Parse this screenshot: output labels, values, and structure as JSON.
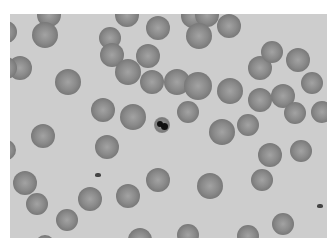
{
  "image": {
    "description": "Grayscale light micrograph of a blood smear showing many red blood cells and one central leukocyte with dark nucleus",
    "frame": {
      "x": 10,
      "y": 14,
      "width": 317,
      "height": 224
    },
    "colors": {
      "background": "#cdcdcd",
      "rbc_edge": "#6f6f6f",
      "rbc_center": "#a3a3a3",
      "nucleus": "#111111",
      "border": "#ffffff"
    },
    "cells": [
      [
        49,
        15,
        12
      ],
      [
        45,
        35,
        13
      ],
      [
        6,
        32,
        11
      ],
      [
        20,
        68,
        12
      ],
      [
        6,
        68,
        11
      ],
      [
        68,
        82,
        13
      ],
      [
        110,
        38,
        11
      ],
      [
        112,
        55,
        12
      ],
      [
        127,
        15,
        12
      ],
      [
        158,
        28,
        12
      ],
      [
        193,
        16,
        12
      ],
      [
        207,
        15,
        12
      ],
      [
        199,
        36,
        13
      ],
      [
        229,
        26,
        12
      ],
      [
        148,
        56,
        12
      ],
      [
        128,
        72,
        13
      ],
      [
        152,
        82,
        12
      ],
      [
        177,
        82,
        13
      ],
      [
        198,
        86,
        14
      ],
      [
        230,
        91,
        13
      ],
      [
        260,
        68,
        12
      ],
      [
        272,
        52,
        11
      ],
      [
        298,
        60,
        12
      ],
      [
        312,
        83,
        11
      ],
      [
        322,
        112,
        11
      ],
      [
        260,
        100,
        12
      ],
      [
        283,
        96,
        12
      ],
      [
        295,
        113,
        11
      ],
      [
        248,
        125,
        11
      ],
      [
        222,
        132,
        13
      ],
      [
        188,
        112,
        11
      ],
      [
        133,
        117,
        13
      ],
      [
        103,
        110,
        12
      ],
      [
        43,
        136,
        12
      ],
      [
        6,
        150,
        10
      ],
      [
        107,
        147,
        12
      ],
      [
        270,
        155,
        12
      ],
      [
        301,
        151,
        11
      ],
      [
        25,
        183,
        12
      ],
      [
        37,
        204,
        11
      ],
      [
        67,
        220,
        11
      ],
      [
        90,
        199,
        12
      ],
      [
        128,
        196,
        12
      ],
      [
        158,
        180,
        12
      ],
      [
        210,
        186,
        13
      ],
      [
        262,
        180,
        11
      ],
      [
        283,
        224,
        11
      ],
      [
        248,
        236,
        11
      ],
      [
        188,
        235,
        11
      ],
      [
        140,
        240,
        12
      ],
      [
        45,
        245,
        10
      ]
    ],
    "leukocyte": {
      "x": 162,
      "y": 125,
      "r": 8
    },
    "debris": [
      {
        "x": 98,
        "y": 175
      },
      {
        "x": 320,
        "y": 206
      }
    ]
  }
}
